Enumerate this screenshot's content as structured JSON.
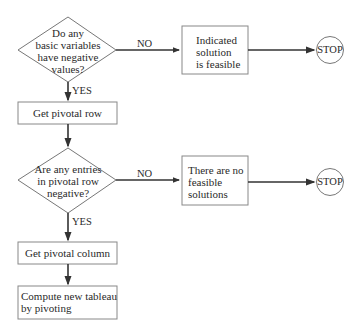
{
  "diagram": {
    "type": "flowchart",
    "nodes": {
      "decision1": {
        "kind": "diamond",
        "lines": [
          "Do any",
          "basic variables",
          "have negative",
          "values?"
        ]
      },
      "box_feasible": {
        "kind": "process",
        "lines": [
          "Indicated",
          "solution",
          "is feasible"
        ]
      },
      "stop1": {
        "kind": "terminator",
        "label": "STOP"
      },
      "box_pivot_row": {
        "kind": "process",
        "label": "Get pivotal row"
      },
      "decision2": {
        "kind": "diamond",
        "lines": [
          "Are any entries",
          "in pivotal row",
          "negative?"
        ]
      },
      "box_no_feasible": {
        "kind": "process",
        "lines": [
          "There are no",
          "feasible",
          "solutions"
        ]
      },
      "stop2": {
        "kind": "terminator",
        "label": "STOP"
      },
      "box_pivot_col": {
        "kind": "process",
        "label": "Get pivotal column"
      },
      "box_compute": {
        "kind": "process",
        "lines": [
          "Compute new tableau",
          "by pivoting"
        ]
      }
    },
    "edge_labels": {
      "d1_no": "NO",
      "d1_yes": "YES",
      "d2_no": "NO",
      "d2_yes": "YES"
    },
    "edges": [
      {
        "from": "decision1",
        "to": "box_feasible",
        "label": "NO"
      },
      {
        "from": "box_feasible",
        "to": "stop1"
      },
      {
        "from": "decision1",
        "to": "box_pivot_row",
        "label": "YES"
      },
      {
        "from": "box_pivot_row",
        "to": "decision2"
      },
      {
        "from": "decision2",
        "to": "box_no_feasible",
        "label": "NO"
      },
      {
        "from": "box_no_feasible",
        "to": "stop2"
      },
      {
        "from": "decision2",
        "to": "box_pivot_col",
        "label": "YES"
      },
      {
        "from": "box_pivot_col",
        "to": "box_compute"
      }
    ],
    "colors": {
      "stroke": "#555555",
      "text": "#2a2a2a",
      "background": "#ffffff"
    }
  }
}
